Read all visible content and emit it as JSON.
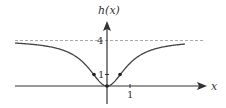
{
  "chart_data": {
    "type": "line",
    "title": "",
    "xlabel": "x",
    "ylabel": "h(x)",
    "function": "h(x) = 4x^2/(1+x^2)",
    "asymptote": {
      "y": 4,
      "style": "dashed"
    },
    "x_ticks": [
      {
        "value": 1,
        "label": "1"
      }
    ],
    "y_ticks": [
      {
        "value": 1,
        "label": "1"
      },
      {
        "value": 4,
        "label": "4"
      }
    ],
    "marked_points": [
      {
        "x": -0.577,
        "y": 1
      },
      {
        "x": 0,
        "y": 0
      },
      {
        "x": 0.577,
        "y": 1
      }
    ],
    "xlim": [
      -4,
      4
    ],
    "ylim": [
      -0.6,
      4.6
    ],
    "grid": false,
    "colors": {
      "curve": "#444444",
      "axis": "#333333",
      "asymptote": "#aaaaaa",
      "points": "#222222"
    }
  },
  "labels": {
    "ylabel": "h(x)",
    "xlabel": "x",
    "tick_x_1": "1",
    "tick_y_1": "1",
    "tick_y_4": "4"
  }
}
